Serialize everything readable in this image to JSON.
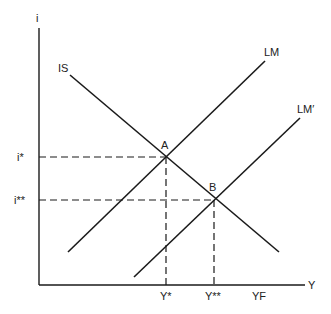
{
  "diagram": {
    "type": "IS-LM",
    "axes": {
      "y_label": "i",
      "x_label": "Y"
    },
    "curves": {
      "is": {
        "label": "IS"
      },
      "lm": {
        "label": "LM"
      },
      "lm_prime": {
        "label": "LM′"
      }
    },
    "points": {
      "a": {
        "label": "A"
      },
      "b": {
        "label": "B"
      }
    },
    "y_ticks": {
      "i_star": "i*",
      "i_double_star": "i**"
    },
    "x_ticks": {
      "y_star": "Y*",
      "y_double_star": "Y**",
      "yf": "YF"
    }
  }
}
